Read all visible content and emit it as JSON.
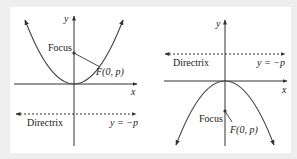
{
  "figure": {
    "background": "#eeeeee",
    "panel_background": "#ffffff",
    "stroke_color": "#333333",
    "left_diagram": {
      "description": "Parabola opening upward, x^2 = 4py with p > 0",
      "axis_x_label": "x",
      "axis_y_label": "y",
      "focus_label": "Focus",
      "focus_point_label": "F(0, p)",
      "directrix_label": "Directrix",
      "directrix_equation": "y = −p"
    },
    "right_diagram": {
      "description": "Parabola opening downward, x^2 = 4py with p < 0",
      "axis_x_label": "x",
      "axis_y_label": "y",
      "focus_label": "Focus",
      "focus_point_label": "F(0, p)",
      "directrix_label": "Directrix",
      "directrix_equation": "y = −p"
    }
  }
}
